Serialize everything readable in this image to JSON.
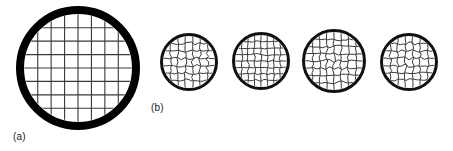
{
  "figure": {
    "caption_labels": {
      "panel_a": "(a)",
      "panel_b": "(b)"
    },
    "background_color": "#ffffff",
    "ink_color": "#000000",
    "mesh_color": "#3a3a3a",
    "label_color": "#1a1a1a",
    "width": 453,
    "height": 151
  },
  "chart_data": {
    "type": "diagram",
    "title": "",
    "subtitle": "",
    "xlabel": "",
    "ylabel": "",
    "grid": false,
    "legend_position": "none",
    "annotations": [
      "(a)",
      "(b)"
    ],
    "panels": [
      {
        "name": "a",
        "label": "(a)",
        "label_x": 13,
        "label_y": 131,
        "objects": [
          {
            "id": "grid-large",
            "shape": "circle",
            "cx": 78,
            "cy": 68,
            "r": 62,
            "ring_thickness": 8,
            "ring_color": "#000000",
            "mesh_color": "#3a3a3a",
            "mesh_line_width": 1.1,
            "mesh_cols": 7,
            "mesh_rows": 7,
            "mesh_wavy": false,
            "wave_amplitude": 0.0
          }
        ]
      },
      {
        "name": "b",
        "label": "(b)",
        "label_x": 151,
        "label_y": 102,
        "objects": [
          {
            "id": "grid-small-1",
            "shape": "circle",
            "cx": 189,
            "cy": 62,
            "r": 29,
            "ring_thickness": 3,
            "ring_color": "#111111",
            "mesh_color": "#3a3a3a",
            "mesh_line_width": 1.0,
            "mesh_cols": 6,
            "mesh_rows": 6,
            "mesh_wavy": true,
            "wave_amplitude": 1.7
          },
          {
            "id": "grid-small-2",
            "shape": "circle",
            "cx": 261,
            "cy": 61,
            "r": 29,
            "ring_thickness": 3,
            "ring_color": "#111111",
            "mesh_color": "#3a3a3a",
            "mesh_line_width": 1.0,
            "mesh_cols": 7,
            "mesh_rows": 7,
            "mesh_wavy": true,
            "wave_amplitude": 1.1
          },
          {
            "id": "grid-small-3",
            "shape": "circle",
            "cx": 334,
            "cy": 61,
            "r": 32,
            "ring_thickness": 3,
            "ring_color": "#111111",
            "mesh_color": "#3a3a3a",
            "mesh_line_width": 1.0,
            "mesh_cols": 7,
            "mesh_rows": 7,
            "mesh_wavy": true,
            "wave_amplitude": 1.6
          },
          {
            "id": "grid-small-4",
            "shape": "circle",
            "cx": 409,
            "cy": 62,
            "r": 29,
            "ring_thickness": 3,
            "ring_color": "#111111",
            "mesh_color": "#3a3a3a",
            "mesh_line_width": 1.0,
            "mesh_cols": 6,
            "mesh_rows": 6,
            "mesh_wavy": true,
            "wave_amplitude": 1.8
          }
        ]
      }
    ]
  }
}
